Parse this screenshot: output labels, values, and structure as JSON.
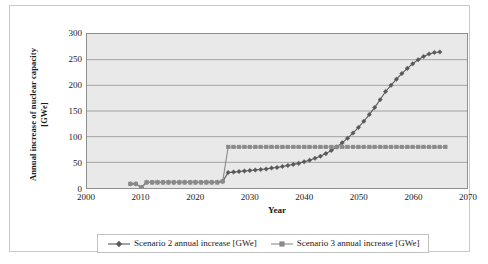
{
  "chart_data": {
    "type": "line",
    "title": "",
    "xlabel": "Year",
    "ylabel": "Annual increase of nuclear capacity [GWe]",
    "ylabel_line1": "Annual increase of nuclear capacity",
    "ylabel_line2": "[GWe]",
    "xlim": [
      2000,
      2070
    ],
    "ylim": [
      0,
      300
    ],
    "xticks": [
      "2000",
      "2010",
      "2020",
      "2030",
      "2040",
      "2050",
      "2060",
      "2070"
    ],
    "yticks": [
      "0",
      "50",
      "100",
      "150",
      "200",
      "250",
      "300"
    ],
    "grid": "horizontal",
    "plot_background": "#e9e9e9",
    "legend_position": "bottom",
    "series": [
      {
        "name": "Scenario 2 annual increase [GWe]",
        "marker": "diamond",
        "color": "#595959",
        "x": [
          2008,
          2009,
          2010,
          2011,
          2012,
          2013,
          2014,
          2015,
          2016,
          2017,
          2018,
          2019,
          2020,
          2021,
          2022,
          2023,
          2024,
          2025,
          2026,
          2027,
          2028,
          2029,
          2030,
          2031,
          2032,
          2033,
          2034,
          2035,
          2036,
          2037,
          2038,
          2039,
          2040,
          2041,
          2042,
          2043,
          2044,
          2045,
          2046,
          2047,
          2048,
          2049,
          2050,
          2051,
          2052,
          2053,
          2054,
          2055,
          2056,
          2057,
          2058,
          2059,
          2060,
          2061,
          2062,
          2063,
          2064,
          2065
        ],
        "values": [
          8,
          8,
          1,
          11,
          11,
          11,
          11,
          11,
          11,
          11,
          11,
          11,
          11,
          11,
          11,
          11,
          11,
          13,
          30,
          31,
          32,
          33,
          34,
          35,
          36,
          37,
          39,
          40,
          42,
          44,
          46,
          48,
          51,
          54,
          58,
          62,
          67,
          73,
          80,
          88,
          97,
          107,
          118,
          130,
          143,
          157,
          172,
          188,
          200,
          212,
          223,
          233,
          242,
          250,
          256,
          261,
          264,
          265
        ]
      },
      {
        "name": "Scenario 3 annual increase [GWe]",
        "marker": "square",
        "color": "#8a8a8a",
        "x": [
          2008,
          2009,
          2010,
          2011,
          2012,
          2013,
          2014,
          2015,
          2016,
          2017,
          2018,
          2019,
          2020,
          2021,
          2022,
          2023,
          2024,
          2025,
          2026,
          2027,
          2028,
          2029,
          2030,
          2031,
          2032,
          2033,
          2034,
          2035,
          2036,
          2037,
          2038,
          2039,
          2040,
          2041,
          2042,
          2043,
          2044,
          2045,
          2046,
          2047,
          2048,
          2049,
          2050,
          2051,
          2052,
          2053,
          2054,
          2055,
          2056,
          2057,
          2058,
          2059,
          2060,
          2061,
          2062,
          2063,
          2064,
          2065,
          2066
        ],
        "values": [
          8,
          8,
          1,
          11,
          11,
          11,
          11,
          11,
          11,
          11,
          11,
          11,
          11,
          11,
          11,
          11,
          11,
          13,
          80,
          80,
          80,
          80,
          80,
          80,
          80,
          80,
          80,
          80,
          80,
          80,
          80,
          80,
          80,
          80,
          80,
          80,
          80,
          80,
          80,
          80,
          80,
          80,
          80,
          80,
          80,
          80,
          80,
          80,
          80,
          80,
          80,
          80,
          80,
          80,
          80,
          80,
          80,
          80,
          80
        ]
      }
    ]
  },
  "legend": {
    "entries": [
      {
        "label": "Scenario 2 annual increase [GWe]",
        "marker": "diamond",
        "color": "#595959"
      },
      {
        "label": "Scenario 3 annual increase [GWe]",
        "marker": "square",
        "color": "#8a8a8a"
      }
    ]
  }
}
